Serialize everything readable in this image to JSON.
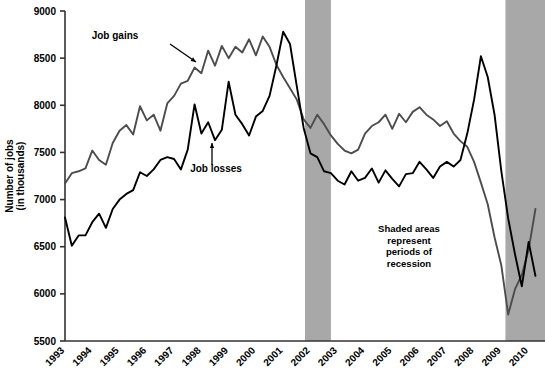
{
  "chart_data": {
    "type": "line",
    "title": "",
    "xlabel": "",
    "ylabel": "Number of jobs\n(in thousands)",
    "ylabel_line1": "Number of jobs",
    "ylabel_line2": "(in thousands)",
    "ylim": [
      5500,
      9000
    ],
    "ytick_step": 500,
    "ytick_labels": [
      "9000",
      "8500",
      "8000",
      "7500",
      "7000",
      "6500",
      "6000",
      "5500"
    ],
    "ytick_values": [
      9000,
      8500,
      8000,
      7500,
      7000,
      6500,
      6000,
      5500
    ],
    "xlim": [
      1993,
      2010.6
    ],
    "xtick_labels": [
      "1993",
      "1994",
      "1995",
      "1996",
      "1997",
      "1998",
      "1999",
      "2000",
      "2001",
      "2002",
      "2003",
      "2004",
      "2005",
      "2006",
      "2007",
      "2008",
      "2009",
      "2010"
    ],
    "xtick_values": [
      1993,
      1994,
      1995,
      1996,
      1997,
      1998,
      1999,
      2000,
      2001,
      2002,
      2003,
      2004,
      2005,
      2006,
      2007,
      2008,
      2009,
      2010
    ],
    "grid": false,
    "legend_position": "inline-annotations",
    "series": [
      {
        "name": "Job gains",
        "color": "#4d4d4d",
        "x": [
          1993.0,
          1993.25,
          1993.5,
          1993.75,
          1994.0,
          1994.25,
          1994.5,
          1994.75,
          1995.0,
          1995.25,
          1995.5,
          1995.75,
          1996.0,
          1996.25,
          1996.5,
          1996.75,
          1997.0,
          1997.25,
          1997.5,
          1997.75,
          1998.0,
          1998.25,
          1998.5,
          1998.75,
          1999.0,
          1999.25,
          1999.5,
          1999.75,
          2000.0,
          2000.25,
          2000.5,
          2000.75,
          2001.0,
          2001.25,
          2001.5,
          2001.75,
          2002.0,
          2002.25,
          2002.5,
          2002.75,
          2003.0,
          2003.25,
          2003.5,
          2003.75,
          2004.0,
          2004.25,
          2004.5,
          2004.75,
          2005.0,
          2005.25,
          2005.5,
          2005.75,
          2006.0,
          2006.25,
          2006.5,
          2006.75,
          2007.0,
          2007.25,
          2007.5,
          2007.75,
          2008.0,
          2008.25,
          2008.5,
          2008.75,
          2009.0,
          2009.25,
          2009.5,
          2009.75,
          2010.0,
          2010.25
        ],
        "values": [
          7170,
          7280,
          7300,
          7330,
          7520,
          7420,
          7370,
          7600,
          7730,
          7790,
          7690,
          7990,
          7840,
          7900,
          7730,
          8020,
          8100,
          8230,
          8260,
          8400,
          8340,
          8580,
          8420,
          8630,
          8500,
          8620,
          8560,
          8700,
          8530,
          8730,
          8620,
          8430,
          8300,
          8180,
          8060,
          7850,
          7760,
          7900,
          7800,
          7680,
          7590,
          7520,
          7490,
          7530,
          7700,
          7780,
          7820,
          7900,
          7750,
          7910,
          7820,
          7930,
          7980,
          7900,
          7850,
          7780,
          7830,
          7700,
          7620,
          7560,
          7400,
          7180,
          6950,
          6600,
          6300,
          5780,
          6050,
          6200,
          6470,
          6900
        ]
      },
      {
        "name": "Job losses",
        "color": "#000000",
        "x": [
          1993.0,
          1993.25,
          1993.5,
          1993.75,
          1994.0,
          1994.25,
          1994.5,
          1994.75,
          1995.0,
          1995.25,
          1995.5,
          1995.75,
          1996.0,
          1996.25,
          1996.5,
          1996.75,
          1997.0,
          1997.25,
          1997.5,
          1997.75,
          1998.0,
          1998.25,
          1998.5,
          1998.75,
          1999.0,
          1999.25,
          1999.5,
          1999.75,
          2000.0,
          2000.25,
          2000.5,
          2000.75,
          2001.0,
          2001.25,
          2001.5,
          2001.75,
          2002.0,
          2002.25,
          2002.5,
          2002.75,
          2003.0,
          2003.25,
          2003.5,
          2003.75,
          2004.0,
          2004.25,
          2004.5,
          2004.75,
          2005.0,
          2005.25,
          2005.5,
          2005.75,
          2006.0,
          2006.25,
          2006.5,
          2006.75,
          2007.0,
          2007.25,
          2007.5,
          2007.75,
          2008.0,
          2008.25,
          2008.5,
          2008.75,
          2009.0,
          2009.25,
          2009.5,
          2009.75,
          2010.0,
          2010.25
        ],
        "values": [
          6810,
          6510,
          6620,
          6620,
          6760,
          6850,
          6700,
          6900,
          7000,
          7060,
          7100,
          7290,
          7250,
          7320,
          7420,
          7450,
          7430,
          7320,
          7530,
          8010,
          7700,
          7820,
          7630,
          7740,
          8250,
          7900,
          7800,
          7680,
          7880,
          7940,
          8100,
          8420,
          8780,
          8650,
          8200,
          7760,
          7490,
          7450,
          7300,
          7280,
          7200,
          7160,
          7300,
          7200,
          7230,
          7330,
          7180,
          7310,
          7220,
          7140,
          7270,
          7280,
          7400,
          7320,
          7230,
          7350,
          7400,
          7350,
          7420,
          7700,
          8060,
          8520,
          8300,
          7900,
          7300,
          6800,
          6420,
          6080,
          6550,
          6190
        ]
      }
    ],
    "shaded_regions": [
      {
        "label": "recession",
        "x0": 2001.8,
        "x1": 2002.75,
        "color": "#a8a8a8"
      },
      {
        "label": "recession",
        "x0": 2009.15,
        "x1": 2010.6,
        "color": "#a8a8a8"
      }
    ],
    "annotations": [
      {
        "name": "job-gains",
        "text": "Job gains",
        "x": 115,
        "y": 39,
        "arrow_from": [
          170,
          44
        ],
        "arrow_to": [
          196,
          62
        ]
      },
      {
        "name": "job-losses",
        "text": "Job losses",
        "x": 216,
        "y": 172,
        "arrow_from": [
          212,
          165
        ],
        "arrow_to": [
          212,
          143
        ]
      }
    ],
    "note": {
      "lines": [
        "Shaded areas",
        "represent",
        "periods of",
        "recession"
      ],
      "x": 409,
      "y": 232
    }
  }
}
